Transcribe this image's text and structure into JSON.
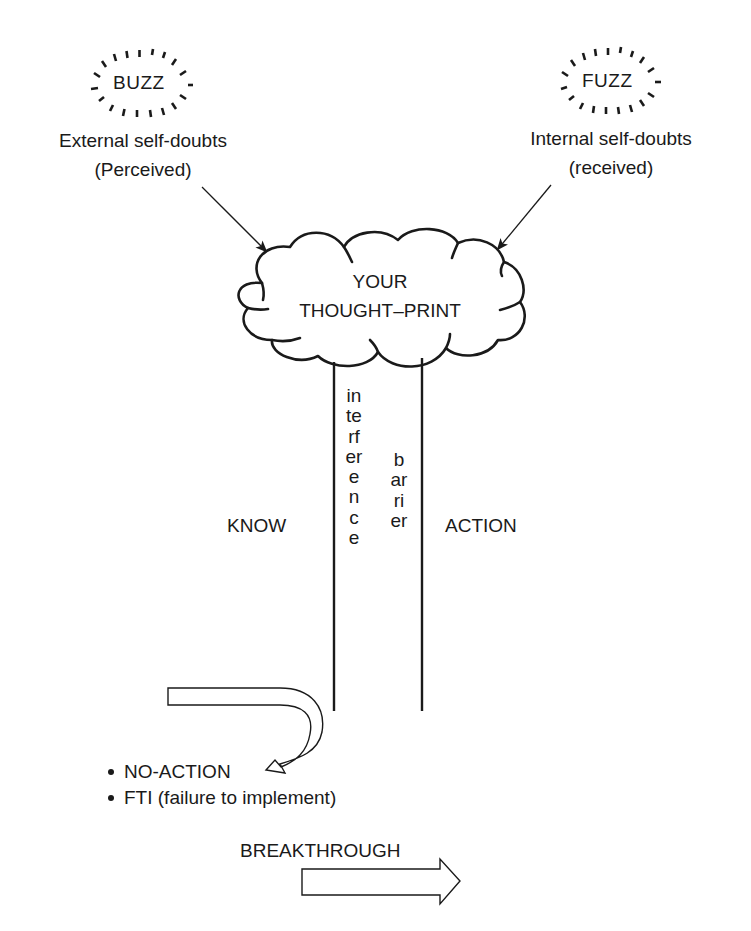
{
  "diagram": {
    "buzz": {
      "word": "BUZZ",
      "caption_line1": "External self-doubts",
      "caption_line2": "(Perceived)"
    },
    "fuzz": {
      "word": "FUZZ",
      "caption_line1": "Internal self-doubts",
      "caption_line2": "(received)"
    },
    "cloud": {
      "line1": "YOUR",
      "line2": "THOUGHT–PRINT"
    },
    "pillar": {
      "left_vertical_word": "interference",
      "right_vertical_word": "barrier"
    },
    "know_label": "KNOW",
    "action_label": "ACTION",
    "outcomes": [
      "NO-ACTION",
      "FTI (failure to implement)"
    ],
    "breakthrough_label": "BREAKTHROUGH",
    "icons": {
      "buzz_burst": "burst-oval-icon",
      "fuzz_burst": "burst-oval-icon",
      "cloud": "thought-cloud-icon",
      "u_turn_arrow": "u-turn-arrow-icon",
      "breakthrough_arrow": "hollow-right-arrow-icon"
    },
    "colors": {
      "ink": "#1a1a1a",
      "background": "#ffffff"
    }
  }
}
